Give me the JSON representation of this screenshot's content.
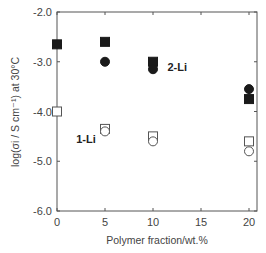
{
  "chart_data": {
    "type": "scatter",
    "title": "",
    "xlabel": "Polymer fraction/wt.%",
    "ylabel": "log(σi / S cm⁻¹) at 30°C",
    "xlim": [
      0,
      20
    ],
    "ylim": [
      -6.0,
      -2.0
    ],
    "x_ticks": [
      0,
      5,
      10,
      15,
      20
    ],
    "x_tick_labels": [
      "0",
      "5",
      "10",
      "15",
      "20"
    ],
    "y_ticks": [
      -2.0,
      -3.0,
      -4.0,
      -5.0,
      -6.0
    ],
    "y_tick_labels": [
      "-2.0",
      "-3.0",
      "-4.0",
      "-5.0",
      "-6.0"
    ],
    "grid": false,
    "legend": null,
    "annotations": [
      {
        "text": "2-Li",
        "x": 11.5,
        "y": -3.1
      },
      {
        "text": "1-Li",
        "x": 2.0,
        "y": -4.55
      }
    ],
    "series": [
      {
        "name": "2-Li (filled square)",
        "marker": "square",
        "filled": true,
        "x": [
          0,
          5,
          10,
          20
        ],
        "y": [
          -2.65,
          -2.6,
          -3.0,
          -3.75
        ]
      },
      {
        "name": "2-Li (filled circle)",
        "marker": "circle",
        "filled": true,
        "x": [
          5,
          10,
          20
        ],
        "y": [
          -3.0,
          -3.15,
          -3.55
        ]
      },
      {
        "name": "1-Li (open square)",
        "marker": "square",
        "filled": false,
        "x": [
          0,
          5,
          10,
          20
        ],
        "y": [
          -4.0,
          -4.35,
          -4.5,
          -4.6
        ]
      },
      {
        "name": "1-Li (open circle)",
        "marker": "circle",
        "filled": false,
        "x": [
          5,
          10,
          20
        ],
        "y": [
          -4.4,
          -4.6,
          -4.8
        ]
      }
    ]
  }
}
